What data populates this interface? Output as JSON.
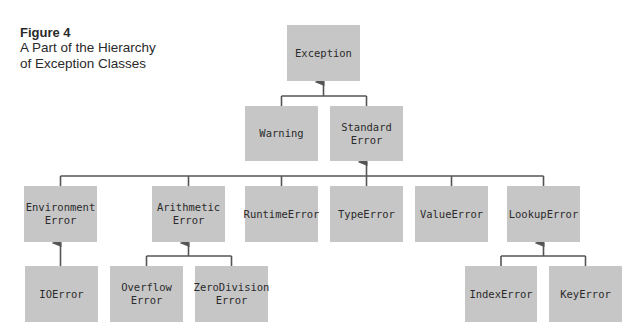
{
  "caption": {
    "figure_label": "Figure 4",
    "title_line1": "A Part of the Hierarchy",
    "title_line2": "of Exception Classes"
  },
  "colors": {
    "box": "#c6c6c6",
    "line": "#555555",
    "text": "#2b2b2b"
  },
  "nodes": [
    {
      "id": "exception",
      "label": "Exception",
      "x": 287,
      "y": 25,
      "w": 73,
      "h": 56,
      "parent": null
    },
    {
      "id": "warning",
      "label": "Warning",
      "x": 245,
      "y": 106,
      "w": 73,
      "h": 55,
      "parent": "exception"
    },
    {
      "id": "standard-error",
      "label": "Standard\nError",
      "x": 330,
      "y": 106,
      "w": 73,
      "h": 55,
      "parent": "exception"
    },
    {
      "id": "environment-error",
      "label": "Environment\nError",
      "x": 24,
      "y": 186,
      "w": 73,
      "h": 56,
      "parent": "standard-error"
    },
    {
      "id": "arithmetic-error",
      "label": "Arithmetic\nError",
      "x": 152,
      "y": 186,
      "w": 73,
      "h": 56,
      "parent": "standard-error"
    },
    {
      "id": "runtime-error",
      "label": "RuntimeError",
      "x": 245,
      "y": 186,
      "w": 73,
      "h": 56,
      "parent": "standard-error"
    },
    {
      "id": "type-error",
      "label": "TypeError",
      "x": 330,
      "y": 186,
      "w": 73,
      "h": 56,
      "parent": "standard-error"
    },
    {
      "id": "value-error",
      "label": "ValueError",
      "x": 415,
      "y": 186,
      "w": 73,
      "h": 56,
      "parent": "standard-error"
    },
    {
      "id": "lookup-error",
      "label": "LookupError",
      "x": 507,
      "y": 186,
      "w": 73,
      "h": 56,
      "parent": "standard-error"
    },
    {
      "id": "io-error",
      "label": "IOError",
      "x": 25,
      "y": 266,
      "w": 73,
      "h": 56,
      "parent": "environment-error"
    },
    {
      "id": "overflow-error",
      "label": "Overflow\nError",
      "x": 110,
      "y": 266,
      "w": 73,
      "h": 56,
      "parent": "arithmetic-error"
    },
    {
      "id": "zero-division-error",
      "label": "ZeroDivision\nError",
      "x": 195,
      "y": 266,
      "w": 73,
      "h": 56,
      "parent": "arithmetic-error"
    },
    {
      "id": "index-error",
      "label": "IndexError",
      "x": 465,
      "y": 266,
      "w": 72,
      "h": 56,
      "parent": "lookup-error"
    },
    {
      "id": "key-error",
      "label": "KeyError",
      "x": 549,
      "y": 266,
      "w": 73,
      "h": 56,
      "parent": "lookup-error"
    }
  ]
}
